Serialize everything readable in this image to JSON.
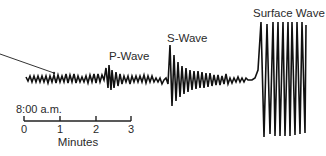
{
  "diagram": {
    "labels": {
      "p_wave": "P-Wave",
      "s_wave": "S-Wave",
      "surface_wave": "Surface Wave",
      "start_time": "8:00 a.m.",
      "axis_title": "Minutes"
    },
    "axis": {
      "ticks": [
        "0",
        "1",
        "2",
        "3"
      ],
      "unit": "Minutes"
    },
    "colors": {
      "trace": "#111111",
      "text": "#2a2a2a",
      "background": "#ffffff"
    },
    "segments": [
      {
        "name": "background-noise",
        "description": "small amplitude oscillations before P-wave arrival"
      },
      {
        "name": "p-wave",
        "description": "first arrival, moderate amplitude"
      },
      {
        "name": "s-wave",
        "description": "second arrival, larger amplitude, decaying"
      },
      {
        "name": "surface-wave",
        "description": "largest amplitude oscillations"
      }
    ]
  }
}
